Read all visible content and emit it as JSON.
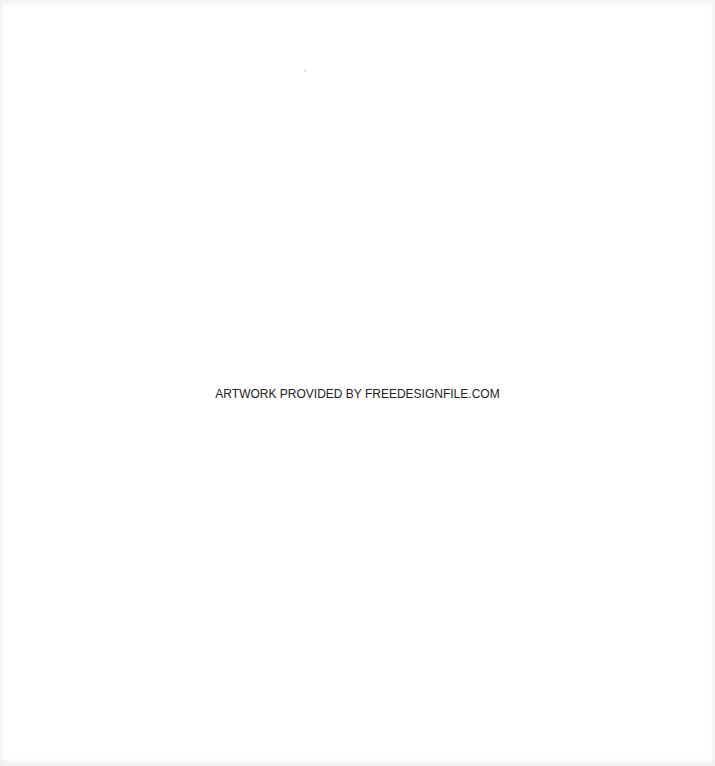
{
  "canvas": {
    "background": "#ffffff",
    "credit_text": "ARTWORK PROVIDED BY FREEDESIGNFILE.COM",
    "credit_color": "#222222"
  }
}
